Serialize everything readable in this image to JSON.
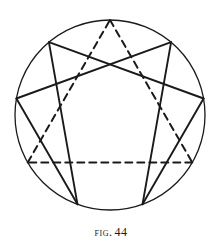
{
  "figure": {
    "caption_label": "Fig.",
    "caption_number": "44",
    "caption_full": "Fig. 44",
    "ink_color": "#1a1a1a",
    "paper_color": "#ffffff"
  },
  "chart_data": {
    "type": "diagram",
    "subtitle": "",
    "xlabel": "",
    "ylabel": "",
    "grid": false,
    "legend_position": "none",
    "circle": {
      "name": "enclosing-circle",
      "center_x": 110,
      "center_y": 115,
      "radius": 95,
      "stroke": "#1a1a1a",
      "stroke_width": 1.3,
      "style": "solid"
    },
    "points": [
      {
        "id": 9,
        "label": "9",
        "angle_deg": 90,
        "x": 110.0,
        "y": 20.0
      },
      {
        "id": 1,
        "label": "1",
        "angle_deg": 50,
        "x": 171.1,
        "y": 42.2
      },
      {
        "id": 2,
        "label": "2",
        "angle_deg": 10,
        "x": 203.6,
        "y": 98.5
      },
      {
        "id": 3,
        "label": "3",
        "angle_deg": 330,
        "x": 192.3,
        "y": 162.5
      },
      {
        "id": 4,
        "label": "4",
        "angle_deg": 290,
        "x": 142.5,
        "y": 204.3
      },
      {
        "id": 5,
        "label": "5",
        "angle_deg": 250,
        "x": 77.5,
        "y": 204.3
      },
      {
        "id": 6,
        "label": "6",
        "angle_deg": 210,
        "x": 27.7,
        "y": 162.5
      },
      {
        "id": 7,
        "label": "7",
        "angle_deg": 170,
        "x": 16.4,
        "y": 98.5
      },
      {
        "id": 8,
        "label": "8",
        "angle_deg": 130,
        "x": 48.9,
        "y": 42.2
      }
    ],
    "series": [
      {
        "name": "dashed-triangle",
        "style": "dashed",
        "stroke": "#1a1a1a",
        "stroke_width": 2.0,
        "dash_pattern": "7 5",
        "path_points": [
          9,
          3,
          6,
          9
        ],
        "segments": [
          {
            "from": 9,
            "to": 3
          },
          {
            "from": 3,
            "to": 6
          },
          {
            "from": 6,
            "to": 9
          }
        ]
      },
      {
        "name": "solid-hexad",
        "style": "solid",
        "stroke": "#1a1a1a",
        "stroke_width": 1.9,
        "path_points": [
          1,
          4,
          2,
          8,
          5,
          7,
          1
        ],
        "segments": [
          {
            "from": 1,
            "to": 4
          },
          {
            "from": 4,
            "to": 2
          },
          {
            "from": 2,
            "to": 8
          },
          {
            "from": 8,
            "to": 5
          },
          {
            "from": 5,
            "to": 7
          },
          {
            "from": 7,
            "to": 1
          }
        ]
      }
    ]
  }
}
